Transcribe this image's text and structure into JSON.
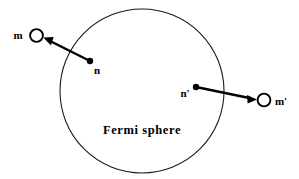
{
  "figure": {
    "type": "physics-scattering-diagram",
    "background_color": "#ffffff",
    "stroke_color": "#000000",
    "width": 299,
    "height": 179
  },
  "sphere": {
    "name": "Fermi sphere",
    "caption": "Fermi sphere",
    "center_x": 142,
    "center_y": 91,
    "radius": 82,
    "stroke_color": "#1a1a1a",
    "stroke_width": 1,
    "fill": "none",
    "caption_x": 142,
    "caption_y": 133
  },
  "arrows": [
    {
      "id": "arrow-n-to-m",
      "direction": "up-left",
      "tail_label": "n",
      "head_label": "m",
      "tail_x": 90,
      "tail_y": 61,
      "head_x": 44,
      "head_y": 38,
      "tail_dot_radius": 3,
      "head_circle_x": 36.5,
      "head_circle_y": 35.5,
      "head_circle_radius": 6.5,
      "tail_label_x": 96,
      "tail_label_y": 73,
      "head_label_x": 18,
      "head_label_y": 39,
      "description": "occupied state n inside Fermi sphere scatters to empty state m outside"
    },
    {
      "id": "arrow-nprime-to-mprime",
      "direction": "right-down",
      "tail_label": "n'",
      "head_label": "m'",
      "tail_x": 196,
      "tail_y": 87,
      "head_x": 256,
      "head_y": 99,
      "tail_dot_radius": 3,
      "head_circle_x": 264,
      "head_circle_y": 100,
      "head_circle_radius": 6.5,
      "tail_label_x": 189,
      "tail_label_y": 97,
      "head_label_x": 275,
      "head_label_y": 105,
      "description": "occupied state n-prime inside Fermi sphere scatters to empty state m-prime outside"
    }
  ],
  "markers": {
    "filled_dot_name": "occupied-state-dot",
    "open_circle_name": "empty-state-circle",
    "open_circle_fill": "#ffffff",
    "open_circle_stroke": "#000000"
  }
}
